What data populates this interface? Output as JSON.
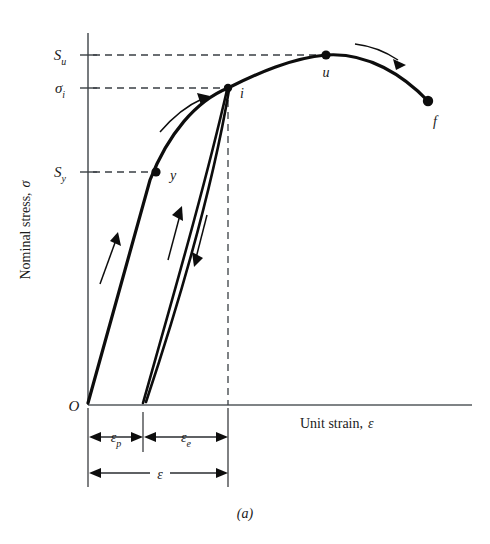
{
  "figure": {
    "caption": "(a)",
    "axes": {
      "y_title_main": "Nominal stress,",
      "y_title_symbol": "σ",
      "x_title_main": "Unit strain,",
      "x_title_symbol": "ε",
      "origin_label": "O"
    },
    "y_ticks": [
      {
        "name": "ultimate-strength",
        "base": "S",
        "subscript": "u",
        "value_y": 55
      },
      {
        "name": "interrupt-stress",
        "base": "σ",
        "subscript": "i",
        "value_y": 88
      },
      {
        "name": "yield-strength",
        "base": "S",
        "subscript": "y",
        "value_y": 172
      }
    ],
    "points": [
      {
        "name": "yield-point",
        "label": "y",
        "x": 156,
        "y": 172
      },
      {
        "name": "interrupt-point",
        "label": "i",
        "x": 228,
        "y": 88
      },
      {
        "name": "ultimate-point",
        "label": "u",
        "x": 326,
        "y": 55
      },
      {
        "name": "fracture-point",
        "label": "f",
        "x": 428,
        "y": 102
      }
    ],
    "dimensions": [
      {
        "name": "plastic-strain",
        "base": "ε",
        "subscript": "p",
        "from_x": 88,
        "to_x": 143,
        "row_y": 437
      },
      {
        "name": "elastic-strain",
        "base": "ε",
        "subscript": "e",
        "from_x": 143,
        "to_x": 228,
        "row_y": 437
      },
      {
        "name": "total-strain",
        "base": "ε",
        "subscript": "",
        "from_x": 88,
        "to_x": 228,
        "row_y": 473
      }
    ],
    "colors": {
      "curve": "#0d0d0d",
      "axis": "#555a5e",
      "dashed": "#3a3f44",
      "background": "#ffffff"
    },
    "geometry": {
      "origin_x": 88,
      "origin_y": 405,
      "axis_top_y": 33,
      "axis_right_x": 472,
      "unload_bottom_x": 143
    },
    "arrows": [
      {
        "name": "loading-arrow-elastic",
        "direction": "up-right"
      },
      {
        "name": "loading-arrow-plastic",
        "direction": "up-right-curved"
      },
      {
        "name": "reload-arrow",
        "direction": "up-right"
      },
      {
        "name": "unload-arrow",
        "direction": "down-right"
      },
      {
        "name": "necking-arrow",
        "direction": "right-down-curved"
      }
    ]
  }
}
